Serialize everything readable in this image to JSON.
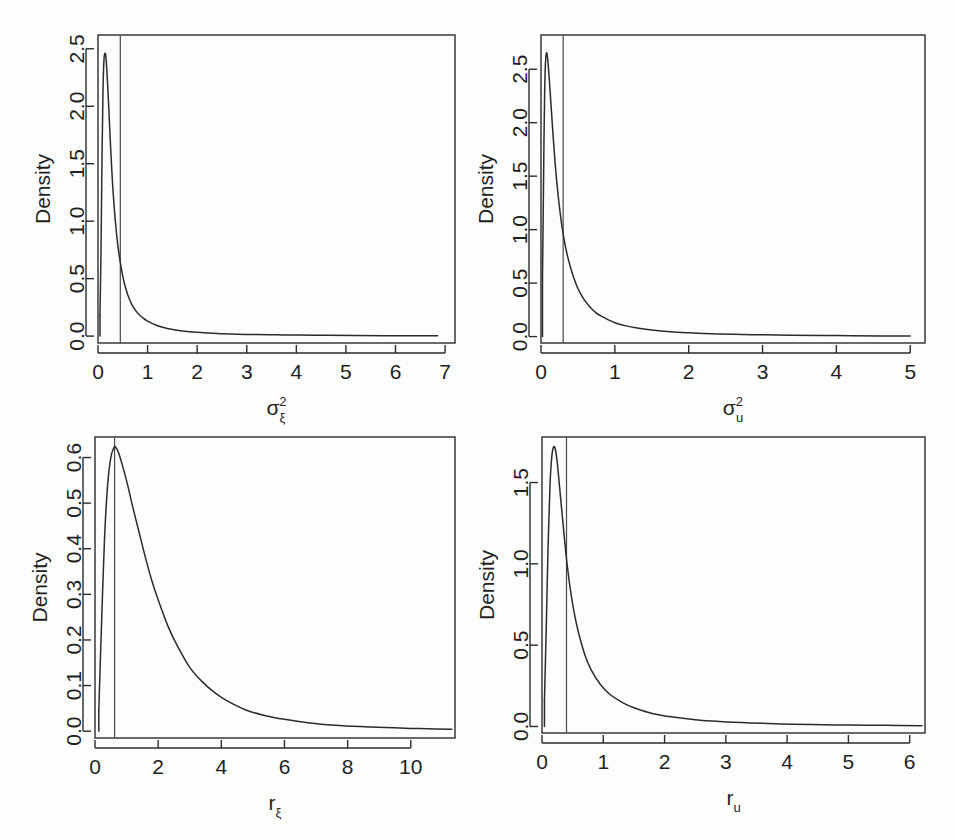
{
  "figure": {
    "background": "#fdfdfd",
    "curve_color": "#2b2b2b",
    "vline_color": "#4a4a4a",
    "axis_color": "#2b2b2b",
    "width": 955,
    "height": 840
  },
  "chart_data": [
    {
      "type": "line",
      "panel": "top-left",
      "title": "",
      "xlabel": "σ²ξ",
      "xlabel_base": "σ",
      "xlabel_sup": "2",
      "xlabel_sub": "ξ",
      "ylabel": "Density",
      "xlim": [
        0,
        7.2
      ],
      "ylim": [
        -0.06,
        2.62
      ],
      "xticks": [
        0,
        1,
        2,
        3,
        4,
        5,
        6,
        7
      ],
      "xticklabels": [
        "0",
        "1",
        "2",
        "3",
        "4",
        "5",
        "6",
        "7"
      ],
      "yticks": [
        0.0,
        0.5,
        1.0,
        1.5,
        2.0,
        2.5
      ],
      "yticklabels": [
        "0.0",
        "0.5",
        "1.0",
        "1.5",
        "2.0",
        "2.5"
      ],
      "grid": false,
      "legend": "none",
      "vline_x": 0.45,
      "series": [
        {
          "name": "posterior density",
          "x": [
            0.04,
            0.06,
            0.08,
            0.1,
            0.12,
            0.14,
            0.16,
            0.18,
            0.2,
            0.22,
            0.25,
            0.28,
            0.31,
            0.35,
            0.4,
            0.45,
            0.5,
            0.55,
            0.6,
            0.7,
            0.8,
            0.9,
            1.0,
            1.2,
            1.4,
            1.6,
            1.8,
            2.0,
            2.4,
            2.8,
            3.2,
            3.6,
            4.0,
            4.6,
            5.2,
            5.8,
            6.4,
            6.85
          ],
          "y": [
            0.18,
            0.72,
            1.52,
            2.12,
            2.4,
            2.46,
            2.43,
            2.3,
            2.14,
            1.96,
            1.68,
            1.43,
            1.22,
            1.0,
            0.79,
            0.64,
            0.52,
            0.43,
            0.36,
            0.26,
            0.2,
            0.16,
            0.13,
            0.09,
            0.066,
            0.051,
            0.04,
            0.033,
            0.023,
            0.017,
            0.013,
            0.011,
            0.009,
            0.007,
            0.005,
            0.004,
            0.003,
            0.003
          ]
        }
      ]
    },
    {
      "type": "line",
      "panel": "top-right",
      "title": "",
      "xlabel": "σ²u",
      "xlabel_base": "σ",
      "xlabel_sup": "2",
      "xlabel_sub": "u",
      "ylabel": "Density",
      "xlim": [
        0,
        5.2
      ],
      "ylim": [
        -0.06,
        2.82
      ],
      "xticks": [
        0,
        1,
        2,
        3,
        4,
        5
      ],
      "xticklabels": [
        "0",
        "1",
        "2",
        "3",
        "4",
        "5"
      ],
      "yticks": [
        0.0,
        0.5,
        1.0,
        1.5,
        2.0,
        2.5
      ],
      "yticklabels": [
        "0.0",
        "0.5",
        "1.0",
        "1.5",
        "2.0",
        "2.5"
      ],
      "grid": false,
      "legend": "none",
      "vline_x": 0.3,
      "series": [
        {
          "name": "posterior density",
          "x": [
            0.02,
            0.03,
            0.04,
            0.05,
            0.06,
            0.07,
            0.08,
            0.09,
            0.1,
            0.12,
            0.14,
            0.17,
            0.2,
            0.24,
            0.28,
            0.32,
            0.36,
            0.42,
            0.5,
            0.58,
            0.66,
            0.75,
            0.85,
            1.0,
            1.15,
            1.3,
            1.5,
            1.75,
            2.0,
            2.3,
            2.6,
            3.0,
            3.4,
            3.8,
            4.2,
            4.6,
            5.0
          ],
          "y": [
            0.55,
            1.15,
            1.82,
            2.3,
            2.55,
            2.64,
            2.65,
            2.6,
            2.52,
            2.33,
            2.12,
            1.82,
            1.55,
            1.27,
            1.05,
            0.88,
            0.75,
            0.6,
            0.45,
            0.35,
            0.28,
            0.22,
            0.18,
            0.13,
            0.1,
            0.08,
            0.062,
            0.046,
            0.036,
            0.027,
            0.021,
            0.016,
            0.012,
            0.01,
            0.008,
            0.006,
            0.005
          ]
        }
      ]
    },
    {
      "type": "line",
      "panel": "bottom-left",
      "title": "",
      "xlabel": "rξ",
      "xlabel_base": "r",
      "xlabel_sup": "",
      "xlabel_sub": "ξ",
      "ylabel": "Density",
      "xlim": [
        0,
        11.4
      ],
      "ylim": [
        -0.015,
        0.645
      ],
      "xticks": [
        0,
        2,
        4,
        6,
        8,
        10
      ],
      "xticklabels": [
        "0",
        "2",
        "4",
        "6",
        "8",
        "10"
      ],
      "yticks": [
        0.0,
        0.1,
        0.2,
        0.3,
        0.4,
        0.5,
        0.6
      ],
      "yticklabels": [
        "0.0",
        "0.1",
        "0.2",
        "0.3",
        "0.4",
        "0.5",
        "0.6"
      ],
      "grid": false,
      "legend": "none",
      "vline_x": 0.62,
      "series": [
        {
          "name": "posterior density",
          "x": [
            0.12,
            0.2,
            0.3,
            0.4,
            0.5,
            0.6,
            0.65,
            0.75,
            0.9,
            1.05,
            1.2,
            1.4,
            1.6,
            1.8,
            2.0,
            2.3,
            2.6,
            3.0,
            3.4,
            3.8,
            4.2,
            4.8,
            5.4,
            6.0,
            6.8,
            7.6,
            8.4,
            9.2,
            10.0,
            10.8,
            11.3
          ],
          "y": [
            0.045,
            0.22,
            0.42,
            0.54,
            0.6,
            0.622,
            0.623,
            0.61,
            0.575,
            0.535,
            0.49,
            0.435,
            0.38,
            0.33,
            0.288,
            0.232,
            0.188,
            0.14,
            0.108,
            0.084,
            0.066,
            0.046,
            0.034,
            0.026,
            0.018,
            0.013,
            0.01,
            0.008,
            0.006,
            0.005,
            0.004
          ]
        }
      ]
    },
    {
      "type": "line",
      "panel": "bottom-right",
      "title": "",
      "xlabel": "ru",
      "xlabel_base": "r",
      "xlabel_sup": "",
      "xlabel_sub": "u",
      "ylabel": "Density",
      "xlim": [
        0,
        6.25
      ],
      "ylim": [
        -0.04,
        1.78
      ],
      "xticks": [
        0,
        1,
        2,
        3,
        4,
        5,
        6
      ],
      "xticklabels": [
        "0",
        "1",
        "2",
        "3",
        "4",
        "5",
        "6"
      ],
      "yticks": [
        0.0,
        0.5,
        1.0,
        1.5
      ],
      "yticklabels": [
        "0.0",
        "0.5",
        "1.0",
        "1.5"
      ],
      "grid": false,
      "legend": "none",
      "vline_x": 0.4,
      "series": [
        {
          "name": "posterior density",
          "x": [
            0.04,
            0.07,
            0.1,
            0.13,
            0.16,
            0.19,
            0.22,
            0.25,
            0.28,
            0.32,
            0.36,
            0.4,
            0.46,
            0.52,
            0.6,
            0.7,
            0.8,
            0.95,
            1.1,
            1.3,
            1.5,
            1.8,
            2.1,
            2.5,
            2.9,
            3.4,
            3.9,
            4.4,
            5.0,
            5.6,
            6.2
          ],
          "y": [
            0.16,
            0.62,
            1.12,
            1.48,
            1.66,
            1.72,
            1.7,
            1.62,
            1.5,
            1.34,
            1.18,
            1.03,
            0.85,
            0.71,
            0.57,
            0.44,
            0.35,
            0.26,
            0.2,
            0.15,
            0.115,
            0.08,
            0.06,
            0.042,
            0.031,
            0.022,
            0.016,
            0.012,
            0.009,
            0.007,
            0.005
          ]
        }
      ]
    }
  ],
  "panels_geometry": [
    {
      "left": 98,
      "top": 35,
      "right": 455,
      "bottom": 343
    },
    {
      "left": 541,
      "top": 35,
      "right": 925,
      "bottom": 343
    },
    {
      "left": 95,
      "top": 437,
      "right": 455,
      "bottom": 738
    },
    {
      "left": 542,
      "top": 437,
      "right": 925,
      "bottom": 733
    }
  ]
}
